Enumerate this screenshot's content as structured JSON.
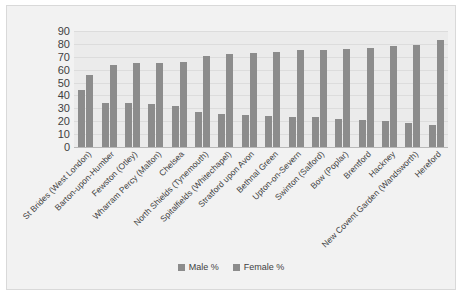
{
  "chart_data": {
    "type": "bar",
    "title": "",
    "subtitle": "",
    "xlabel": "",
    "ylabel": "",
    "ylim": [
      0,
      90
    ],
    "ytick_step": 10,
    "yticks": [
      90,
      80,
      70,
      60,
      50,
      40,
      30,
      20,
      10,
      0
    ],
    "grid": true,
    "legend_position": "bottom",
    "categories": [
      "St Brides (West London)",
      "Barton-upon-Humber",
      "Fewston (Otley)",
      "Wharram Percy (Malton)",
      "Chelsea",
      "North Shields (Tynemouth)",
      "Spitalfields (Whitechapel)",
      "Stratford upon Avon",
      "Bethnal Green",
      "Upton-on-Severn",
      "Swinton (Salford)",
      "Bow (Poplar)",
      "Brentford",
      "Hackney",
      "New Covent Garden (Wandsworth)",
      "Hereford"
    ],
    "series": [
      {
        "name": "Male %",
        "color": "#8c8c8c",
        "values": [
          44,
          34,
          34,
          33,
          32,
          27,
          26,
          25,
          24,
          23,
          23,
          22,
          21,
          20,
          19,
          17
        ]
      },
      {
        "name": "Female %",
        "color": "#8c8c8c",
        "values": [
          56,
          64,
          65,
          65,
          66,
          71,
          72,
          73,
          74,
          75,
          75,
          76,
          77,
          78,
          79,
          83
        ]
      }
    ]
  },
  "legend": {
    "items": [
      {
        "label": "Male %",
        "color": "#8c8c8c"
      },
      {
        "label": "Female %",
        "color": "#8c8c8c"
      }
    ]
  },
  "colors": {
    "bar": "#8c8c8c",
    "plot_background": "#ebebeb",
    "frame_background": "#f2f2f2",
    "gridline": "#dcdcdc",
    "text": "#3f3f3f"
  }
}
